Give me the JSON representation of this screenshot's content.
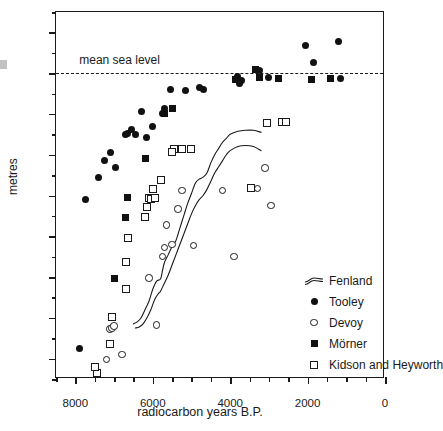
{
  "chart_data": {
    "type": "scatter",
    "title": "",
    "xlabel": "radiocarbon years B.P.",
    "ylabel": "metres",
    "xlim": [
      8500,
      0
    ],
    "ylim": [
      -15,
      3
    ],
    "x_ticks": [
      8000,
      6000,
      4000,
      2000,
      0
    ],
    "x_tick_labels": [
      "8000",
      "6000",
      "4000",
      "2000",
      "0"
    ],
    "x_minor_step": 500,
    "y_ticks": [
      2,
      0,
      -2,
      -4,
      -6,
      -8,
      -10,
      -12,
      -14
    ],
    "y_tick_labels": [
      "+2",
      "0",
      "-2",
      "-4",
      "-6",
      "-8",
      "-10",
      "-12",
      "-14"
    ],
    "y_minor_step": 1,
    "grid": false,
    "annotations": [
      {
        "name": "mean-sea-level",
        "text": "mean sea level",
        "y": 0,
        "style": "dashed-horizontal-line"
      }
    ],
    "legend_position": "inside-lower-right",
    "series": [
      {
        "name": "Fenland",
        "marker": "band",
        "description": "two near-parallel curves forming an envelope",
        "upper": [
          [
            6500,
            -12.3
          ],
          [
            6400,
            -12.2
          ],
          [
            6300,
            -12.0
          ],
          [
            6200,
            -11.6
          ],
          [
            6100,
            -11.2
          ],
          [
            6000,
            -10.6
          ],
          [
            5900,
            -10.2
          ],
          [
            5800,
            -10.1
          ],
          [
            5750,
            -9.7
          ],
          [
            5700,
            -9.3
          ],
          [
            5600,
            -8.9
          ],
          [
            5500,
            -8.5
          ],
          [
            5400,
            -8.2
          ],
          [
            5300,
            -7.6
          ],
          [
            5200,
            -7.0
          ],
          [
            5100,
            -6.4
          ],
          [
            5000,
            -5.9
          ],
          [
            4900,
            -5.4
          ],
          [
            4800,
            -5.2
          ],
          [
            4700,
            -5.1
          ],
          [
            4600,
            -4.9
          ],
          [
            4500,
            -4.4
          ],
          [
            4400,
            -4.0
          ],
          [
            4300,
            -3.7
          ],
          [
            4200,
            -3.4
          ],
          [
            4100,
            -3.2
          ],
          [
            4000,
            -3.0
          ],
          [
            3800,
            -2.85
          ],
          [
            3600,
            -2.8
          ],
          [
            3400,
            -2.8
          ],
          [
            3200,
            -2.9
          ]
        ],
        "lower": [
          [
            6450,
            -12.5
          ],
          [
            6350,
            -12.45
          ],
          [
            6250,
            -12.3
          ],
          [
            6150,
            -12.0
          ],
          [
            6050,
            -11.6
          ],
          [
            5950,
            -11.1
          ],
          [
            5850,
            -10.8
          ],
          [
            5800,
            -10.7
          ],
          [
            5700,
            -10.3
          ],
          [
            5600,
            -9.9
          ],
          [
            5500,
            -9.4
          ],
          [
            5400,
            -8.9
          ],
          [
            5300,
            -8.4
          ],
          [
            5200,
            -7.9
          ],
          [
            5100,
            -7.4
          ],
          [
            5000,
            -6.9
          ],
          [
            4900,
            -6.5
          ],
          [
            4800,
            -6.2
          ],
          [
            4700,
            -6.0
          ],
          [
            4600,
            -5.7
          ],
          [
            4500,
            -5.3
          ],
          [
            4400,
            -4.9
          ],
          [
            4300,
            -4.6
          ],
          [
            4200,
            -4.3
          ],
          [
            4100,
            -4.0
          ],
          [
            4000,
            -3.8
          ],
          [
            3800,
            -3.6
          ],
          [
            3600,
            -3.55
          ],
          [
            3400,
            -3.6
          ],
          [
            3200,
            -3.8
          ]
        ]
      },
      {
        "name": "Tooley",
        "marker": "filled-circle",
        "points": [
          [
            7900,
            -13.5
          ],
          [
            7750,
            -6.2
          ],
          [
            7400,
            -5.1
          ],
          [
            7250,
            -4.3
          ],
          [
            7100,
            -3.9
          ],
          [
            6950,
            -4.65
          ],
          [
            6700,
            -3.0
          ],
          [
            6650,
            -2.95
          ],
          [
            6550,
            -2.75
          ],
          [
            6450,
            -3.0
          ],
          [
            6300,
            -1.9
          ],
          [
            6150,
            -3.15
          ],
          [
            6000,
            -2.6
          ],
          [
            5700,
            -1.75
          ],
          [
            5750,
            -2.0
          ],
          [
            5550,
            -0.8
          ],
          [
            5150,
            -0.85
          ],
          [
            4800,
            -0.7
          ],
          [
            4700,
            -0.8
          ],
          [
            3800,
            -0.15
          ],
          [
            3750,
            -0.5
          ],
          [
            3700,
            -0.35
          ],
          [
            3250,
            0.15
          ],
          [
            3000,
            -0.2
          ],
          [
            2050,
            1.35
          ],
          [
            1850,
            0.5
          ],
          [
            1200,
            1.55
          ],
          [
            1150,
            -0.25
          ]
        ]
      },
      {
        "name": "Devoy",
        "marker": "open-circle",
        "points": [
          [
            7200,
            -14.05
          ],
          [
            7100,
            -12.55
          ],
          [
            7050,
            -12.5
          ],
          [
            7000,
            -12.4
          ],
          [
            6800,
            -13.8
          ],
          [
            6100,
            -10.05
          ],
          [
            5900,
            -12.35
          ],
          [
            5750,
            -9.0
          ],
          [
            5700,
            -8.55
          ],
          [
            5650,
            -7.45
          ],
          [
            5500,
            -8.4
          ],
          [
            5350,
            -6.65
          ],
          [
            5250,
            -5.75
          ],
          [
            4950,
            -8.45
          ],
          [
            4200,
            -5.75
          ],
          [
            3900,
            -9.0
          ],
          [
            3450,
            -5.6
          ],
          [
            3300,
            -5.65
          ],
          [
            3100,
            -4.65
          ],
          [
            2950,
            -6.5
          ]
        ]
      },
      {
        "name": "Mörner",
        "marker": "filled-square",
        "points": [
          [
            7000,
            -10.05
          ],
          [
            6700,
            -7.1
          ],
          [
            6650,
            -6.1
          ],
          [
            6200,
            -4.2
          ],
          [
            5700,
            -2.0
          ],
          [
            5500,
            -1.75
          ],
          [
            3850,
            -0.3
          ],
          [
            3350,
            0.2
          ],
          [
            3250,
            -0.2
          ],
          [
            2750,
            -0.25
          ],
          [
            1900,
            -0.3
          ],
          [
            1400,
            -0.25
          ]
        ]
      },
      {
        "name": "Kidson and Heyworth",
        "marker": "open-square",
        "points": [
          [
            7450,
            -14.7
          ],
          [
            7500,
            -14.4
          ],
          [
            7100,
            -13.3
          ],
          [
            7050,
            -11.95
          ],
          [
            6700,
            -10.6
          ],
          [
            6700,
            -9.25
          ],
          [
            6650,
            -8.1
          ],
          [
            6200,
            -7.05
          ],
          [
            6150,
            -6.55
          ],
          [
            6100,
            -6.1
          ],
          [
            6050,
            -6.15
          ],
          [
            6000,
            -5.7
          ],
          [
            5950,
            -6.1
          ],
          [
            5800,
            -5.25
          ],
          [
            5450,
            -3.7
          ],
          [
            5500,
            -3.85
          ],
          [
            5250,
            -3.7
          ],
          [
            5000,
            -3.7
          ],
          [
            3450,
            -5.65
          ],
          [
            3050,
            -2.45
          ],
          [
            2650,
            -2.4
          ],
          [
            2550,
            -2.4
          ]
        ]
      }
    ]
  },
  "legend": {
    "items": [
      {
        "label": "Fenland",
        "key": "band-icon"
      },
      {
        "label": "Tooley",
        "key": "filled-circle-icon"
      },
      {
        "label": "Devoy",
        "key": "open-circle-icon"
      },
      {
        "label": "Mörner",
        "key": "filled-square-icon"
      },
      {
        "label": "Kidson and Heyworth",
        "key": "open-square-icon"
      }
    ]
  },
  "colors": {
    "ink": "#1a1a1a",
    "background": "#ffffff"
  }
}
